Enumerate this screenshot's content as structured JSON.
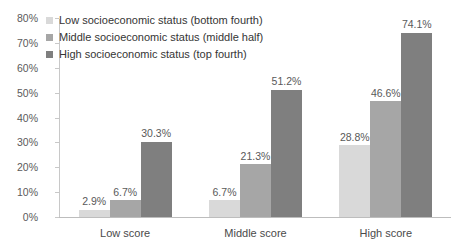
{
  "chart_data": {
    "type": "bar",
    "title": "",
    "subtitle": "",
    "xlabel": "",
    "ylabel": "",
    "categories": [
      "Low score",
      "Middle score",
      "High score"
    ],
    "series": [
      {
        "name": "Low socioeconomic status (bottom fourth)",
        "color": "#d9d9d9",
        "values": [
          2.9,
          6.7,
          28.8
        ],
        "labels": [
          "2.9%",
          "6.7%",
          "28.8%"
        ]
      },
      {
        "name": "Middle socioeconomic status (middle half)",
        "color": "#a6a6a6",
        "values": [
          6.7,
          21.3,
          46.6
        ],
        "labels": [
          "6.7%",
          "21.3%",
          "46.6%"
        ]
      },
      {
        "name": "High socioeconomic status (top fourth)",
        "color": "#7f7f7f",
        "values": [
          30.3,
          51.2,
          74.1
        ],
        "labels": [
          "30.3%",
          "51.2%",
          "74.1%"
        ]
      }
    ],
    "ylim": [
      0,
      80
    ],
    "ytick_labels": [
      "0%",
      "10%",
      "20%",
      "30%",
      "40%",
      "50%",
      "60%",
      "70%",
      "80%"
    ],
    "ytick_values": [
      0,
      10,
      20,
      30,
      40,
      50,
      60,
      70,
      80
    ],
    "grid": false,
    "legend_position": "top-left-inside"
  },
  "legend": {
    "entries": [
      {
        "label": "Low socioeconomic status (bottom fourth)",
        "color": "#d9d9d9"
      },
      {
        "label": "Middle socioeconomic status (middle half)",
        "color": "#a6a6a6"
      },
      {
        "label": "High socioeconomic status (top fourth)",
        "color": "#7f7f7f"
      }
    ]
  },
  "axes": {
    "y_labels": [
      "80%",
      "70%",
      "60%",
      "50%",
      "40%",
      "30%",
      "20%",
      "10%",
      "0%"
    ],
    "x_labels": [
      "Low score",
      "Middle score",
      "High score"
    ]
  }
}
